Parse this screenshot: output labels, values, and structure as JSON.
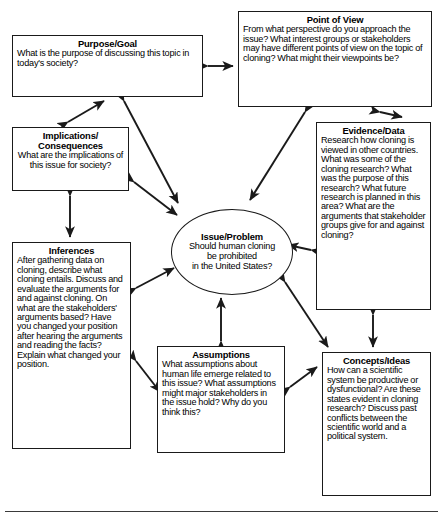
{
  "diagram": {
    "center": {
      "label": "Issue/Problem",
      "text": "Should human cloning\nbe prohibited\nin the United States?"
    },
    "nodes": [
      {
        "id": "purpose",
        "label": "Purpose/Goal",
        "text": "What is the purpose of discussing this topic in today's society?"
      },
      {
        "id": "point-of-view",
        "label": "Point of View",
        "text": "From what perspective do you approach the issue? What interest groups or stakeholders may have different points of view on the topic of cloning? What might their viewpoints be?"
      },
      {
        "id": "implications-consequences",
        "label": "Implications/\nConsequences",
        "text": "What are the implications of this issue for society?"
      },
      {
        "id": "evidence-data",
        "label": "Evidence/Data",
        "text": "Research how cloning is viewed in other countries. What was some of the cloning research? What was the purpose of this research? What future research is planned in this area? What are the arguments that stakeholder groups give for and against cloning?"
      },
      {
        "id": "inferences",
        "label": "Inferences",
        "text": "After gathering data on cloning, describe what cloning entails. Discuss and evaluate the arguments for and against cloning. On what are the stakeholders' arguments based? Have you changed your position after hearing the arguments and reading the facts? Explain what changed your position."
      },
      {
        "id": "assumptions",
        "label": "Assumptions",
        "text": "What assumptions about human life emerge related to this issue? What assumptions might major stakeholders in the issue hold? Why do you think this?"
      },
      {
        "id": "concepts-ideas",
        "label": "Concepts/Ideas",
        "text": "How can a scientific system be productive or dysfunctional? Are these states evident in cloning research? Discuss past conflicts between the scientific world and a political system."
      }
    ],
    "connectors": [
      {
        "from": "purpose",
        "to": "point-of-view",
        "style": "double-headed"
      },
      {
        "from": "purpose",
        "to": "implications-consequences",
        "style": "double-headed"
      },
      {
        "from": "purpose",
        "to": "center",
        "style": "double-headed"
      },
      {
        "from": "point-of-view",
        "to": "center",
        "style": "double-headed"
      },
      {
        "from": "point-of-view",
        "to": "evidence-data",
        "style": "double-headed"
      },
      {
        "from": "implications-consequences",
        "to": "center",
        "style": "double-headed"
      },
      {
        "from": "implications-consequences",
        "to": "inferences",
        "style": "double-headed"
      },
      {
        "from": "evidence-data",
        "to": "center",
        "style": "double-headed"
      },
      {
        "from": "evidence-data",
        "to": "concepts-ideas",
        "style": "double-headed"
      },
      {
        "from": "inferences",
        "to": "center",
        "style": "double-headed"
      },
      {
        "from": "inferences",
        "to": "assumptions",
        "style": "double-headed"
      },
      {
        "from": "assumptions",
        "to": "center",
        "style": "double-headed"
      },
      {
        "from": "assumptions",
        "to": "concepts-ideas",
        "style": "double-headed"
      },
      {
        "from": "center",
        "to": "concepts-ideas",
        "style": "double-headed"
      }
    ],
    "colors": {
      "stroke": "#1a1a1a",
      "fill": "#ffffff",
      "text": "#000000",
      "rule": "#3a3a3a"
    }
  }
}
